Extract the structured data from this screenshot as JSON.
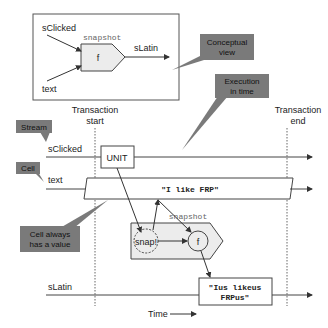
{
  "conceptual": {
    "input1": "sClicked",
    "input2": "text",
    "op_label": "snapshot",
    "func": "f",
    "output": "sLatin"
  },
  "callouts": {
    "conceptual_view": [
      "Conceptual",
      "view"
    ],
    "execution_in_time": [
      "Execution",
      "in time"
    ],
    "stream": "Stream",
    "cell": "Cell",
    "cell_always": [
      "Cell always",
      "has a value"
    ]
  },
  "timeline": {
    "tx_start": [
      "Transaction",
      "start"
    ],
    "tx_end": [
      "Transaction",
      "end"
    ],
    "stream_label": "sClicked",
    "cell_label": "text",
    "unit": "UNIT",
    "cell_value": "\"I like FRP\"",
    "snap": "snap!",
    "func": "f",
    "op_label": "snapshot",
    "output_label": "sLatin",
    "output_value": [
      "\"Ius likeus",
      "FRPus\""
    ],
    "time_label": "Time"
  },
  "colors": {
    "callout_fill": "#7a7a7a",
    "box_fill": "#ececec",
    "line": "#333333"
  }
}
